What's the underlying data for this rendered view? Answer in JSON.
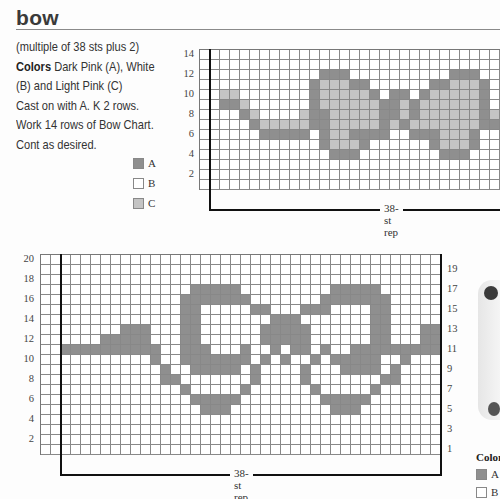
{
  "header": {
    "title": "bow"
  },
  "instructions": {
    "line1": "(multiple of 38 sts plus 2)",
    "colors_label": "Colors",
    "colors_text": " Dark Pink (A), White",
    "line3": "(B) and Light Pink (C)",
    "line4": "Cast on with A. K 2 rows.",
    "line5": "Work 14 rows of Bow Chart.",
    "line6": "Cont as desired."
  },
  "legend_top": {
    "items": [
      {
        "key": "A",
        "label": "A",
        "color": "#8f8f8f"
      },
      {
        "key": "B",
        "label": "B",
        "color": "#ffffff"
      },
      {
        "key": "C",
        "label": "C",
        "color": "#c4c4c4"
      }
    ]
  },
  "colors": {
    "A": "#8f8f8f",
    "B": "#ffffff",
    "C": "#c4c4c4"
  },
  "chart_top": {
    "rows": 14,
    "cols": 31,
    "row_labels_left": [
      "14",
      "12",
      "10",
      "8",
      "6",
      "4",
      "2"
    ],
    "rep_label": "38-st rep",
    "cells": {
      "12": {
        "A": [
          12,
          13,
          14,
          25,
          26,
          27
        ]
      },
      "11": {
        "A": [
          11,
          15,
          16,
          23,
          24,
          28
        ],
        "C": [
          12,
          13,
          14,
          25,
          26,
          27
        ]
      },
      "10": {
        "A": [
          11,
          17,
          19,
          20,
          22,
          28
        ],
        "C": [
          2,
          3,
          12,
          13,
          14,
          15,
          16,
          23,
          24,
          25,
          26,
          27
        ]
      },
      "9": {
        "A": [
          2,
          3,
          11,
          18,
          19,
          21,
          28
        ],
        "C": [
          4,
          12,
          13,
          14,
          15,
          16,
          17,
          20,
          22,
          23,
          24,
          25,
          26,
          27
        ]
      },
      "8": {
        "A": [
          4,
          11,
          12,
          18,
          19,
          21,
          28
        ],
        "C": [
          5,
          10,
          13,
          14,
          15,
          16,
          17,
          20,
          22,
          23,
          24,
          25,
          26,
          27,
          29
        ]
      },
      "7": {
        "A": [
          5,
          11,
          12,
          18,
          20,
          28,
          29,
          30
        ],
        "C": [
          6,
          7,
          8,
          9,
          10,
          13,
          14,
          15,
          16,
          17,
          19,
          21,
          22,
          23,
          24,
          25,
          26,
          27
        ]
      },
      "6": {
        "A": [
          6,
          7,
          8,
          9,
          10,
          12,
          15,
          16,
          17,
          18,
          21,
          22,
          23,
          27
        ],
        "C": [
          13,
          14,
          24,
          25,
          26
        ]
      },
      "5": {
        "A": [
          12,
          16,
          23,
          27
        ],
        "C": [
          13,
          14,
          15,
          24,
          25,
          26
        ]
      },
      "4": {
        "A": [
          13,
          14,
          15,
          24,
          25,
          26
        ]
      }
    }
  },
  "chart_bottom": {
    "rows": 20,
    "cols": 40,
    "row_labels_left": [
      "20",
      "18",
      "16",
      "14",
      "12",
      "10",
      "8",
      "6",
      "4",
      "2"
    ],
    "row_labels_right": [
      "19",
      "17",
      "15",
      "13",
      "11",
      "9",
      "7",
      "5",
      "3",
      "1"
    ],
    "rep_label": "38-st rep",
    "cells": {
      "17": {
        "A": [
          15,
          16,
          17,
          18,
          19,
          29,
          30,
          31,
          32,
          33
        ]
      },
      "16": {
        "A": [
          14,
          15,
          16,
          17,
          18,
          19,
          20,
          28,
          29,
          30,
          31,
          32,
          33,
          34
        ]
      },
      "15": {
        "A": [
          14,
          15,
          21,
          22,
          26,
          27,
          28,
          33,
          34
        ]
      },
      "14": {
        "A": [
          14,
          15,
          23,
          24,
          25,
          33,
          34
        ]
      },
      "13": {
        "A": [
          8,
          9,
          10,
          14,
          15,
          22,
          23,
          24,
          25,
          26,
          33,
          34,
          38,
          39
        ]
      },
      "12": {
        "A": [
          6,
          7,
          8,
          9,
          10,
          14,
          15,
          22,
          23,
          24,
          25,
          26,
          33,
          34,
          38,
          39
        ]
      },
      "11": {
        "A": [
          2,
          3,
          4,
          5,
          6,
          7,
          8,
          9,
          10,
          11,
          14,
          15,
          16,
          20,
          23,
          25,
          26,
          28,
          31,
          32,
          33,
          34,
          35,
          36,
          37,
          38,
          39,
          40
        ]
      },
      "10": {
        "A": [
          11,
          14,
          15,
          16,
          17,
          18,
          19,
          20,
          22,
          24,
          27,
          29,
          30,
          31,
          32,
          33,
          36
        ]
      },
      "9": {
        "A": [
          12,
          15,
          16,
          17,
          18,
          19,
          21,
          26,
          30,
          31,
          32,
          33,
          35
        ]
      },
      "8": {
        "A": [
          12,
          13,
          21,
          26,
          34,
          35
        ]
      },
      "7": {
        "A": [
          14,
          20,
          27,
          33
        ]
      },
      "6": {
        "A": [
          15,
          16,
          17,
          18,
          19,
          28,
          29,
          30,
          31,
          32
        ]
      },
      "5": {
        "A": [
          16,
          17,
          18,
          29,
          30,
          31
        ]
      }
    }
  },
  "photo_panel": {
    "caption": "Color",
    "legend": [
      {
        "key": "A",
        "label": "A"
      },
      {
        "key": "B",
        "label": "B"
      }
    ]
  }
}
